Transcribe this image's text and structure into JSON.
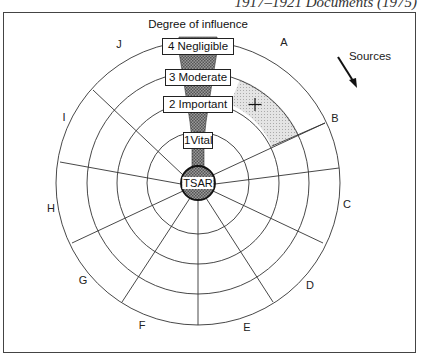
{
  "caption": "1917–1921 Documents (1975)",
  "diagram": {
    "title": "Degree of influence",
    "center_label": "TSAR",
    "tiers": [
      {
        "level": 4,
        "label": "4 Negligible"
      },
      {
        "level": 3,
        "label": "3 Moderate"
      },
      {
        "level": 2,
        "label": "2 Important"
      },
      {
        "level": 1,
        "label": "1Vital"
      }
    ],
    "sectors": [
      "A",
      "B",
      "C",
      "D",
      "E",
      "F",
      "G",
      "H",
      "I",
      "J"
    ],
    "highlight_marker": "+",
    "sources_label": "Sources",
    "colors": {
      "line": "#333333",
      "hatch": "#888888",
      "highlight": "#cccccc"
    }
  }
}
